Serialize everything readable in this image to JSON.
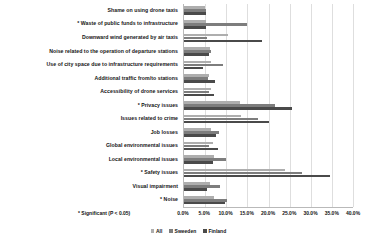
{
  "chart_data": {
    "type": "bar",
    "orientation": "horizontal",
    "title": "",
    "xlabel": "",
    "ylabel": "",
    "xlim": [
      0,
      40
    ],
    "grid": true,
    "legend_position": "bottom-center",
    "xticks": [
      "0.0%",
      "5.0%",
      "10.0%",
      "15.0%",
      "20.0%",
      "25.0%",
      "30.0%",
      "35.0%",
      "40.0%"
    ],
    "xtick_values": [
      0,
      5,
      10,
      15,
      20,
      25,
      30,
      35,
      40
    ],
    "categories": [
      "Shame on using drone taxis",
      "* Waste of public funds to infrastructure",
      "Downward wind generated by air taxis",
      "Noise related to the operation of departure stations",
      "Use of city space due to infrastructure requirements",
      "Additional traffic from/to stations",
      "Accessibility of drone services",
      "* Privacy issues",
      "Issues related to crime",
      "Job losses",
      "Global environmental issues",
      "Local environmental issues",
      "* Safety issues",
      "Visual impairment",
      "* Noise"
    ],
    "series": [
      {
        "name": "All",
        "color": "#aeaeae",
        "values": [
          5.0,
          5.3,
          10.5,
          6.2,
          6.4,
          6.0,
          6.5,
          13.3,
          13.6,
          6.3,
          6.8,
          7.0,
          24.0,
          6.2,
          7.0
        ]
      },
      {
        "name": "Sweeden",
        "color": "#7d7d7d",
        "values": [
          5.2,
          14.8,
          5.5,
          6.4,
          9.3,
          5.6,
          6.0,
          21.5,
          17.5,
          8.4,
          6.0,
          10.0,
          28.0,
          8.6,
          10.2
        ]
      },
      {
        "name": "Finland",
        "color": "#4a4a4a",
        "values": [
          5.1,
          5.2,
          18.5,
          6.0,
          4.5,
          7.4,
          7.2,
          25.5,
          20.2,
          7.6,
          8.0,
          6.8,
          34.5,
          5.5,
          9.7
        ]
      }
    ],
    "footnote": "* Significant (P < 0.05)"
  }
}
